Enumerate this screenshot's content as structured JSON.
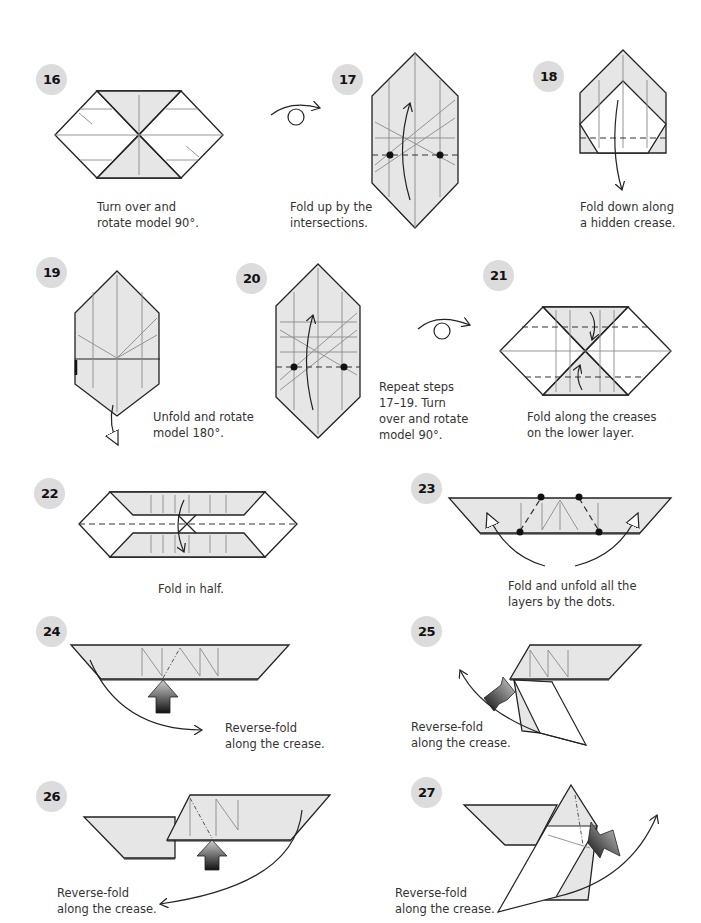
{
  "colors": {
    "paper_colored": "#e6e6e6",
    "paper_white": "#ffffff",
    "badge": "#dcdcdc",
    "line": "#222222"
  },
  "steps": [
    {
      "number": "16",
      "caption": "Turn over and\nrotate model 90°."
    },
    {
      "number": "17",
      "caption": "Fold up by the\nintersections."
    },
    {
      "number": "18",
      "caption": "Fold down along\na hidden crease."
    },
    {
      "number": "19",
      "caption": "Unfold and rotate\nmodel 180°."
    },
    {
      "number": "20",
      "caption": "Repeat steps\n17–19. Turn\nover and rotate\nmodel 90°."
    },
    {
      "number": "21",
      "caption": "Fold along the creases\non the lower layer."
    },
    {
      "number": "22",
      "caption": "Fold in half."
    },
    {
      "number": "23",
      "caption": "Fold and unfold all the\nlayers by the dots."
    },
    {
      "number": "24",
      "caption": "Reverse-fold\nalong the crease."
    },
    {
      "number": "25",
      "caption": "Reverse-fold\nalong the crease."
    },
    {
      "number": "26",
      "caption": "Reverse-fold\nalong the crease."
    },
    {
      "number": "27",
      "caption": "Reverse-fold\nalong the crease."
    }
  ],
  "symbols": {
    "turn_over_1": "turn-over-symbol",
    "turn_over_2": "turn-over-symbol"
  }
}
